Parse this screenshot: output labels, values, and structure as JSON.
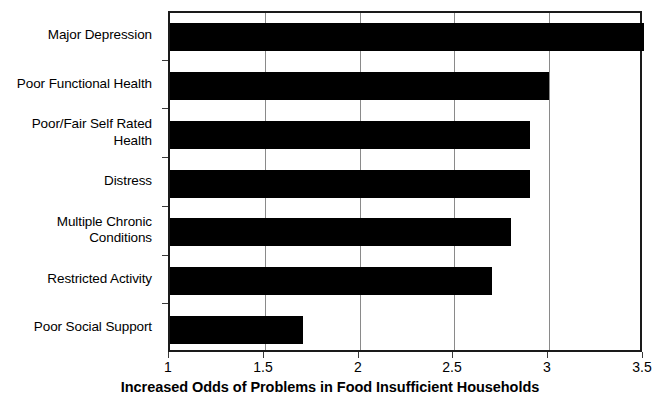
{
  "chart_data": {
    "type": "bar",
    "orientation": "horizontal",
    "title": "",
    "xlabel": "Increased Odds of Problems in Food Insufficient Households",
    "ylabel": "",
    "xlim": [
      1,
      3.5
    ],
    "xticks": [
      "1",
      "1.5",
      "2",
      "2.5",
      "3",
      "3.5"
    ],
    "xtick_values": [
      1,
      1.5,
      2,
      2.5,
      3,
      3.5
    ],
    "grid": true,
    "grid_axis": "x",
    "legend": false,
    "bar_color": "#000000",
    "background_color": "#ffffff",
    "axis_color": "#1a1a1a",
    "gridline_color": "#8a8a8a",
    "categories": [
      "Major Depression",
      "Poor Functional Health",
      "Poor/Fair Self Rated Health",
      "Distress",
      "Multiple Chronic Conditions",
      "Restricted Activity",
      "Poor Social Support"
    ],
    "category_lines": [
      [
        "Major Depression"
      ],
      [
        "Poor Functional Health"
      ],
      [
        "Poor/Fair Self Rated",
        "Health"
      ],
      [
        "Distress"
      ],
      [
        "Multiple Chronic",
        "Conditions"
      ],
      [
        "Restricted Activity"
      ],
      [
        "Poor Social Support"
      ]
    ],
    "values": [
      3.5,
      3.0,
      2.9,
      2.9,
      2.8,
      2.7,
      1.7
    ]
  }
}
